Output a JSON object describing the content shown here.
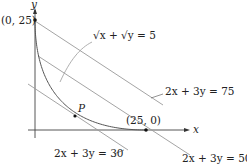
{
  "figure": {
    "axes": {
      "x_label": "x",
      "y_label": "y"
    },
    "curve": {
      "label": "√x + √y = 5",
      "equation": "sqrt(x) + sqrt(y) = 5"
    },
    "points": [
      {
        "label": "(0, 25)",
        "x": 0,
        "y": 25
      },
      {
        "label": "(25, 0)",
        "x": 25,
        "y": 0
      },
      {
        "label": "P",
        "x": 9,
        "y": 4
      }
    ],
    "lines": [
      {
        "label": "2x + 3y = 30",
        "c": 30
      },
      {
        "label": "2x + 3y = 50",
        "c": 50
      },
      {
        "label": "2x + 3y = 75",
        "c": 75
      }
    ],
    "colors": {
      "ink": "#222222",
      "line": "#9a9a9a",
      "curve": "#555555"
    }
  }
}
